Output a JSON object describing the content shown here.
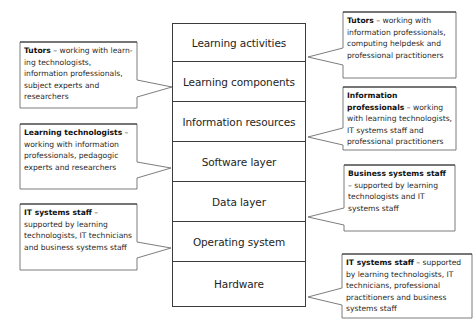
{
  "stack": {
    "layers": [
      {
        "label": "Learning activities"
      },
      {
        "label": "Learning components"
      },
      {
        "label": "Information resources"
      },
      {
        "label": "Software layer"
      },
      {
        "label": "Data layer"
      },
      {
        "label": "Operating system"
      },
      {
        "label": "Hardware"
      }
    ]
  },
  "callouts_left": [
    {
      "role": "Tutors",
      "sep": " – ",
      "text": "working with learn-ing technologists, information professionals, subject experts and researchers",
      "points_to": "Learning components"
    },
    {
      "role": "Learning technologists",
      "sep": " – ",
      "text": "working with information professionals, pedagogic experts and researchers",
      "points_to": "Software layer"
    },
    {
      "role": "IT systems staff",
      "sep": " – ",
      "text": "supported by learning technologists, IT technicians and business systems staff",
      "points_to": "Operating system"
    }
  ],
  "callouts_right": [
    {
      "role": "Tutors",
      "sep": " – ",
      "text": "working with information professionals, computing helpdesk and professional practitioners",
      "points_to": "Learning activities"
    },
    {
      "role": "Information professionals",
      "sep": " – ",
      "text": "working with learning technologists, IT systems staff and professional practitioners",
      "points_to": "Information resources"
    },
    {
      "role": "Business systems staff",
      "sep": " – ",
      "text": "supported by learning technologists and IT systems staff",
      "points_to": "Data layer"
    },
    {
      "role": "IT systems staff",
      "sep": " – ",
      "text": "supported by learning technologists, IT technicians, professional practitioners and business systems staff",
      "points_to": "Hardware"
    }
  ],
  "colors": {
    "line": "#3c3c3c",
    "pointer": "#6e6e6e",
    "background": "#ffffff"
  }
}
